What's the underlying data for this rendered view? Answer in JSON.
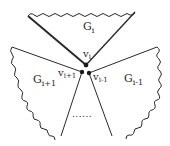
{
  "diagram": {
    "regions": [
      {
        "id": "G_i",
        "label_base": "G",
        "label_sub": "i"
      },
      {
        "id": "G_i+1",
        "label_base": "G",
        "label_sub": "i+1"
      },
      {
        "id": "G_i-1",
        "label_base": "G",
        "label_sub": "i-1"
      }
    ],
    "vertices": [
      {
        "id": "v_i",
        "label_base": "v",
        "label_sub": "i"
      },
      {
        "id": "v_i+1",
        "label_base": "v",
        "label_sub": "i+1"
      },
      {
        "id": "v_i-1",
        "label_base": "v",
        "label_sub": "i-1"
      }
    ],
    "ellipsis": "......",
    "colors": {
      "stroke": "#2a2a2a",
      "background": "#ffffff"
    }
  }
}
